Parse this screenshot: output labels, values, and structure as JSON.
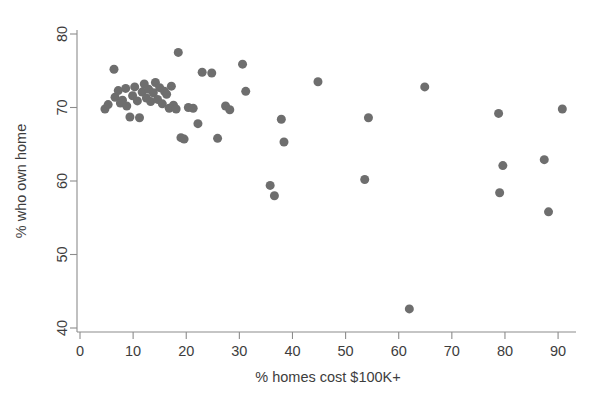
{
  "chart_data": {
    "type": "scatter",
    "title": "",
    "xlabel": "% homes cost $100K+",
    "ylabel": "% who own home",
    "xlim": [
      -3,
      94
    ],
    "ylim": [
      38.5,
      81.5
    ],
    "xticks": [
      0,
      10,
      20,
      30,
      40,
      50,
      60,
      70,
      80,
      90
    ],
    "yticks": [
      40,
      50,
      60,
      70,
      80
    ],
    "grid": false,
    "legend": null,
    "marker_color": "#6e6e6e",
    "marker_size_px": 9,
    "n_points": 56,
    "points": [
      {
        "x": 4.7,
        "y": 69.8
      },
      {
        "x": 5.3,
        "y": 70.4
      },
      {
        "x": 6.4,
        "y": 75.2
      },
      {
        "x": 6.6,
        "y": 71.4
      },
      {
        "x": 7.2,
        "y": 72.3
      },
      {
        "x": 7.6,
        "y": 70.6
      },
      {
        "x": 8.0,
        "y": 71.0
      },
      {
        "x": 8.6,
        "y": 72.6
      },
      {
        "x": 8.8,
        "y": 70.2
      },
      {
        "x": 9.4,
        "y": 68.7
      },
      {
        "x": 9.9,
        "y": 71.6
      },
      {
        "x": 10.3,
        "y": 72.8
      },
      {
        "x": 10.8,
        "y": 70.9
      },
      {
        "x": 11.2,
        "y": 68.6
      },
      {
        "x": 11.7,
        "y": 72.1
      },
      {
        "x": 12.1,
        "y": 73.2
      },
      {
        "x": 12.5,
        "y": 71.3
      },
      {
        "x": 12.9,
        "y": 72.5
      },
      {
        "x": 13.3,
        "y": 70.8
      },
      {
        "x": 13.8,
        "y": 72.0
      },
      {
        "x": 14.2,
        "y": 73.4
      },
      {
        "x": 14.6,
        "y": 71.1
      },
      {
        "x": 15.0,
        "y": 72.7
      },
      {
        "x": 15.5,
        "y": 70.5
      },
      {
        "x": 15.9,
        "y": 72.2
      },
      {
        "x": 16.3,
        "y": 71.8
      },
      {
        "x": 16.8,
        "y": 69.9
      },
      {
        "x": 17.2,
        "y": 72.9
      },
      {
        "x": 17.6,
        "y": 70.3
      },
      {
        "x": 18.1,
        "y": 69.8
      },
      {
        "x": 18.5,
        "y": 77.5
      },
      {
        "x": 19.0,
        "y": 65.9
      },
      {
        "x": 19.6,
        "y": 65.7
      },
      {
        "x": 20.4,
        "y": 70.0
      },
      {
        "x": 21.3,
        "y": 69.9
      },
      {
        "x": 22.2,
        "y": 67.8
      },
      {
        "x": 23.0,
        "y": 74.8
      },
      {
        "x": 24.8,
        "y": 74.7
      },
      {
        "x": 25.9,
        "y": 65.8
      },
      {
        "x": 27.4,
        "y": 70.2
      },
      {
        "x": 28.2,
        "y": 69.7
      },
      {
        "x": 30.6,
        "y": 75.9
      },
      {
        "x": 31.2,
        "y": 72.2
      },
      {
        "x": 35.8,
        "y": 59.4
      },
      {
        "x": 36.6,
        "y": 58.0
      },
      {
        "x": 37.9,
        "y": 68.4
      },
      {
        "x": 38.4,
        "y": 65.3
      },
      {
        "x": 44.8,
        "y": 73.5
      },
      {
        "x": 53.6,
        "y": 60.2
      },
      {
        "x": 54.3,
        "y": 68.6
      },
      {
        "x": 62.0,
        "y": 42.6
      },
      {
        "x": 64.9,
        "y": 72.8
      },
      {
        "x": 78.8,
        "y": 69.2
      },
      {
        "x": 79.0,
        "y": 58.4
      },
      {
        "x": 79.6,
        "y": 62.1
      },
      {
        "x": 87.4,
        "y": 62.9
      },
      {
        "x": 88.2,
        "y": 55.8
      },
      {
        "x": 90.8,
        "y": 69.8
      }
    ]
  },
  "axes": {
    "x_tick_labels": [
      "0",
      "10",
      "20",
      "30",
      "40",
      "50",
      "60",
      "70",
      "80",
      "90"
    ],
    "y_tick_labels": [
      "40",
      "50",
      "60",
      "70",
      "80"
    ],
    "x_axis_title": "% homes cost $100K+",
    "y_axis_title": "% who own home"
  }
}
